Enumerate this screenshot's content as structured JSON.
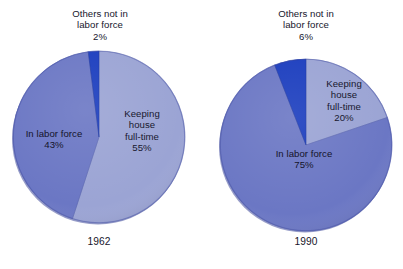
{
  "figure": {
    "background": "#ffffff",
    "width": 403,
    "height": 269
  },
  "palette": {
    "keeping_house": "#9ba4d4",
    "keeping_house_rim": "#8089bd",
    "in_labor_force": "#6b77c4",
    "in_labor_force_rim": "#4c57a5",
    "others_not_in_labor_force": "#1b3dbe",
    "others_rim": "#16319c",
    "text": "#16162c"
  },
  "chart_data": [
    {
      "type": "pie",
      "title": "1962",
      "categories": [
        "Keeping house full-time",
        "In labor force",
        "Others not in labor force"
      ],
      "values": [
        55,
        43,
        2
      ],
      "unit": "%",
      "colors": [
        "#9ba4d4",
        "#6b77c4",
        "#1b3dbe"
      ],
      "start_angle_deg": 0,
      "direction": "clockwise",
      "legend": "none",
      "grid": false,
      "labels": [
        {
          "text": "Keeping\nhouse\nfull-time\n55%",
          "placement": "inside"
        },
        {
          "text": "In labor force\n43%",
          "placement": "inside"
        },
        {
          "text": "Others not in\nlabor force\n2%",
          "placement": "callout-above"
        }
      ]
    },
    {
      "type": "pie",
      "title": "1990",
      "categories": [
        "Keeping house full-time",
        "In labor force",
        "Others not in labor force"
      ],
      "values": [
        20,
        75,
        6
      ],
      "unit": "%",
      "colors": [
        "#9ba4d4",
        "#6b77c4",
        "#1b3dbe"
      ],
      "start_angle_deg": 0,
      "direction": "clockwise",
      "legend": "none",
      "grid": false,
      "labels": [
        {
          "text": "Keeping\nhouse\nfull-time\n20%",
          "placement": "inside"
        },
        {
          "text": "In labor force\n75%",
          "placement": "inside"
        },
        {
          "text": "Others not in\nlabor force\n6%",
          "placement": "callout-above"
        }
      ]
    }
  ],
  "charts": {
    "left": {
      "year": "1962",
      "callout": "Others not in\nlabor force\n2%",
      "keeping_house_label": "Keeping\nhouse\nfull-time\n55%",
      "in_labor_force_label": "In labor force\n43%"
    },
    "right": {
      "year": "1990",
      "callout": "Others not in\nlabor force\n6%",
      "keeping_house_label": "Keeping\nhouse\nfull-time\n20%",
      "in_labor_force_label": "In labor force\n75%"
    }
  }
}
